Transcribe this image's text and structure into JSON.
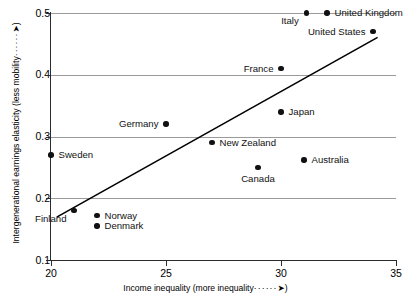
{
  "chart_data": {
    "type": "scatter",
    "title": "",
    "xlabel": "Income inequality (more inequality",
    "xlabel_suffix": ")",
    "ylabel": "Intergenerational earnings elasticity (less mobility",
    "ylabel_suffix": ")",
    "xlim": [
      20,
      35
    ],
    "ylim": [
      0.1,
      0.5
    ],
    "xticks": [
      "20",
      "25",
      "30",
      "35"
    ],
    "xtick_values": [
      20,
      25,
      30,
      35
    ],
    "yticks": [
      "0.5",
      "0.4",
      "0.3",
      "0.2",
      "0.1"
    ],
    "ytick_values": [
      0.5,
      0.4,
      0.3,
      0.2,
      0.1
    ],
    "grid": "horizontal",
    "legend": "none",
    "leader_dots": "······",
    "arrow_glyph": "➤",
    "point_color": "#111111",
    "grid_color": "#9a9a9a",
    "axis_color": "#2b2b2b",
    "trendline": {
      "visible": true,
      "x_start": 20.25,
      "y_start": 0.1695,
      "x_end": 34.2,
      "y_end": 0.4605,
      "color": "#000000"
    },
    "points": [
      {
        "label": "Sweden",
        "x": 20.0,
        "y": 0.27,
        "label_pos": "right"
      },
      {
        "label": "Finland",
        "x": 21.0,
        "y": 0.18,
        "label_pos": "below-left"
      },
      {
        "label": "Norway",
        "x": 22.0,
        "y": 0.172,
        "label_pos": "right"
      },
      {
        "label": "Denmark",
        "x": 22.0,
        "y": 0.155,
        "label_pos": "right"
      },
      {
        "label": "Germany",
        "x": 25.0,
        "y": 0.32,
        "label_pos": "left"
      },
      {
        "label": "New Zealand",
        "x": 27.0,
        "y": 0.29,
        "label_pos": "right"
      },
      {
        "label": "Canada",
        "x": 29.0,
        "y": 0.25,
        "label_pos": "below"
      },
      {
        "label": "France",
        "x": 30.0,
        "y": 0.41,
        "label_pos": "left"
      },
      {
        "label": "Japan",
        "x": 30.0,
        "y": 0.34,
        "label_pos": "right"
      },
      {
        "label": "Australia",
        "x": 31.0,
        "y": 0.262,
        "label_pos": "right"
      },
      {
        "label": "Italy",
        "x": 31.1,
        "y": 0.5,
        "label_pos": "below-left"
      },
      {
        "label": "United Kingdom",
        "x": 32.0,
        "y": 0.5,
        "label_pos": "right"
      },
      {
        "label": "United States",
        "x": 34.0,
        "y": 0.47,
        "label_pos": "left"
      }
    ]
  }
}
